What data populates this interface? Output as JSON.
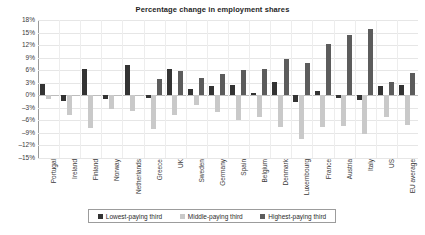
{
  "chart_data": {
    "type": "bar",
    "title": "Percentage change in employment shares",
    "xlabel": "",
    "ylabel": "",
    "ylim": [
      -15,
      18
    ],
    "ytick_step": 3,
    "ytick_labels": [
      "18%",
      "15%",
      "12%",
      "9%",
      "6%",
      "3%",
      "0%",
      "-3%",
      "-6%",
      "-9%",
      "-12%",
      "-15%"
    ],
    "grid": true,
    "legend_position": "bottom",
    "categories": [
      "Portugal",
      "Ireland",
      "Finland",
      "Norway",
      "Netherlands",
      "Greece",
      "UK",
      "Sweden",
      "Germany",
      "Spain",
      "Belgium",
      "Denmark",
      "Luxembourg",
      "France",
      "Austria",
      "Italy",
      "US",
      "EU average"
    ],
    "series": [
      {
        "name": "Lowest-paying third",
        "color": "#333333",
        "values": [
          2.6,
          -1.4,
          6.2,
          -0.8,
          7.2,
          -0.6,
          6.4,
          1.4,
          2.2,
          2.4,
          0.6,
          3.2,
          -1.6,
          1.0,
          -0.6,
          -1.2,
          2.2,
          2.4
        ]
      },
      {
        "name": "Middle-paying third",
        "color": "#c9c9c9",
        "values": [
          -0.8,
          -4.6,
          -7.8,
          -3.4,
          -3.8,
          -8.0,
          -4.6,
          -2.4,
          -4.0,
          -5.8,
          -5.2,
          -7.6,
          -10.4,
          -7.6,
          -7.4,
          -9.2,
          -5.2,
          -7.2
        ]
      },
      {
        "name": "Highest-paying third",
        "color": "#5c5c5c",
        "values": [
          0.0,
          0.0,
          0.0,
          0.0,
          0.0,
          4.0,
          5.8,
          4.2,
          5.0,
          6.0,
          6.4,
          8.6,
          7.8,
          12.2,
          14.4,
          15.8,
          3.2,
          5.4
        ]
      }
    ]
  },
  "legend": {
    "items": [
      {
        "label": "Lowest-paying third"
      },
      {
        "label": "Middle-paying third"
      },
      {
        "label": "Highest-paying third"
      }
    ]
  }
}
